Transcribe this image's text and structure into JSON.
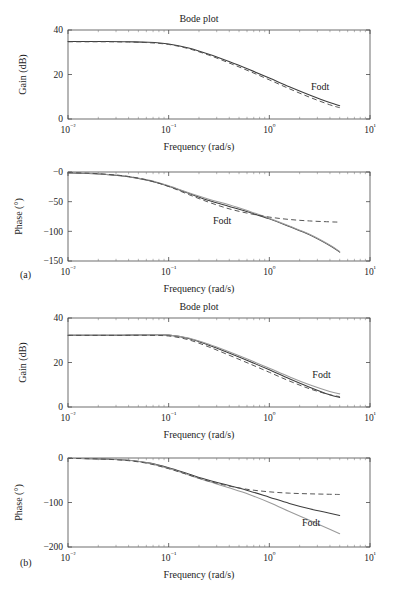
{
  "figure": {
    "panels": [
      {
        "id": "a",
        "label": "(a)"
      },
      {
        "id": "b",
        "label": "(b)"
      }
    ]
  },
  "chart_data": [
    {
      "id": "a-gain",
      "type": "line",
      "title": "Bode plot",
      "xlabel": "Frequency (rad/s)",
      "ylabel": "Gain (dB)",
      "xscale": "log",
      "xlim": [
        0.01,
        10
      ],
      "ylim": [
        0,
        40
      ],
      "xticks": [
        "10⁻²",
        "10⁻¹",
        "10⁰",
        "10¹"
      ],
      "xtick_values": [
        0.01,
        0.1,
        1,
        10
      ],
      "yticks": [
        "0",
        "20",
        "40"
      ],
      "ytick_values": [
        0,
        20,
        40
      ],
      "grid": false,
      "annotations": [
        {
          "text": "Fodt",
          "x": 3.2,
          "y": 13
        }
      ],
      "series": [
        {
          "name": "process",
          "style": "solid",
          "color": "#3d3d3d",
          "x": [
            0.01,
            0.0158,
            0.0251,
            0.0398,
            0.0631,
            0.1,
            0.158,
            0.251,
            0.398,
            0.631,
            1.0,
            1.58,
            2.51,
            3.98,
            5.0
          ],
          "y": [
            34.8,
            34.8,
            34.8,
            34.7,
            34.5,
            33.7,
            31.9,
            29.1,
            25.8,
            22.2,
            18.4,
            14.5,
            10.8,
            7.4,
            6.0
          ]
        },
        {
          "name": "fodt-approximation",
          "style": "dashed",
          "color": "#4d4d4d",
          "x": [
            0.01,
            0.0158,
            0.0251,
            0.0398,
            0.0631,
            0.1,
            0.158,
            0.251,
            0.398,
            0.631,
            1.0,
            1.58,
            2.51,
            3.98,
            5.0
          ],
          "y": [
            34.7,
            34.7,
            34.7,
            34.6,
            34.3,
            33.5,
            31.6,
            28.7,
            25.2,
            21.5,
            17.6,
            13.6,
            9.8,
            6.4,
            5.1
          ]
        }
      ]
    },
    {
      "id": "a-phase",
      "type": "line",
      "title": "",
      "xlabel": "Frequency (rad/s)",
      "ylabel": "Phase (°)",
      "xscale": "log",
      "xlim": [
        0.01,
        10
      ],
      "ylim": [
        -150,
        0
      ],
      "xticks": [
        "10⁻²",
        "10⁻¹",
        "10⁰",
        "10¹"
      ],
      "xtick_values": [
        0.01,
        0.1,
        1,
        10
      ],
      "yticks": [
        "−0",
        "−50",
        "−100",
        "−150"
      ],
      "ytick_values": [
        0,
        -50,
        -100,
        -150
      ],
      "grid": false,
      "annotations": [
        {
          "text": "Fodt",
          "x": 0.34,
          "y": -88
        }
      ],
      "series": [
        {
          "name": "process",
          "style": "solid",
          "color": "#3d3d3d",
          "x": [
            0.01,
            0.0158,
            0.0251,
            0.0398,
            0.0631,
            0.1,
            0.158,
            0.251,
            0.398,
            0.631,
            1.0,
            1.58,
            2.51,
            3.98,
            5.0
          ],
          "y": [
            -1.5,
            -2.5,
            -4.5,
            -8.0,
            -14.5,
            -24.0,
            -36.0,
            -48.0,
            -58.0,
            -68.0,
            -79.0,
            -92.0,
            -106.0,
            -124.0,
            -135.0
          ]
        },
        {
          "name": "process-alt",
          "style": "solid-light",
          "color": "#9a9a9a",
          "x": [
            0.01,
            0.0158,
            0.0251,
            0.0398,
            0.0631,
            0.1,
            0.158,
            0.251,
            0.398,
            0.631,
            1.0,
            1.58,
            2.51,
            3.98,
            5.0
          ],
          "y": [
            -1.2,
            -2.2,
            -4.2,
            -7.5,
            -13.5,
            -23.0,
            -35.0,
            -46.0,
            -55.0,
            -66.0,
            -78.0,
            -91.0,
            -105.0,
            -123.0,
            -134.0
          ]
        },
        {
          "name": "fodt-approximation",
          "style": "dashed",
          "color": "#4d4d4d",
          "x": [
            0.01,
            0.0158,
            0.0251,
            0.0398,
            0.0631,
            0.1,
            0.158,
            0.251,
            0.398,
            0.631,
            1.0,
            1.58,
            2.51,
            3.98,
            5.0
          ],
          "y": [
            -1.0,
            -2.0,
            -4.0,
            -7.5,
            -14.0,
            -24.5,
            -38.0,
            -51.0,
            -62.0,
            -70.0,
            -76.0,
            -80.0,
            -82.5,
            -84.0,
            -84.5
          ]
        }
      ]
    },
    {
      "id": "b-gain",
      "type": "line",
      "title": "Bode plot",
      "xlabel": "Frequency (rad/s)",
      "ylabel": "Gain (dB)",
      "xscale": "log",
      "xlim": [
        0.01,
        10
      ],
      "ylim": [
        0,
        40
      ],
      "xticks": [
        "10⁻²",
        "10⁻¹",
        "10⁰",
        "10¹"
      ],
      "xtick_values": [
        0.01,
        0.1,
        1,
        10
      ],
      "yticks": [
        "0",
        "20",
        "40"
      ],
      "ytick_values": [
        0,
        20,
        40
      ],
      "grid": false,
      "annotations": [
        {
          "text": "Fodt",
          "x": 3.3,
          "y": 13
        }
      ],
      "series": [
        {
          "name": "process",
          "style": "solid",
          "color": "#3d3d3d",
          "x": [
            0.01,
            0.0158,
            0.0251,
            0.0398,
            0.0631,
            0.1,
            0.158,
            0.251,
            0.398,
            0.631,
            1.0,
            1.58,
            2.51,
            3.98,
            5.0
          ],
          "y": [
            32.2,
            32.2,
            32.2,
            32.3,
            32.4,
            32.3,
            30.8,
            27.8,
            24.3,
            20.6,
            16.7,
            12.7,
            8.9,
            5.5,
            4.3
          ]
        },
        {
          "name": "process-alt",
          "style": "solid-light",
          "color": "#9a9a9a",
          "x": [
            0.01,
            0.0158,
            0.0251,
            0.0398,
            0.0631,
            0.1,
            0.158,
            0.251,
            0.398,
            0.631,
            1.0,
            1.58,
            2.51,
            3.98,
            5.0
          ],
          "y": [
            32.3,
            32.3,
            32.3,
            32.4,
            32.5,
            32.4,
            31.0,
            28.2,
            24.8,
            21.2,
            17.4,
            13.6,
            10.0,
            7.0,
            5.9
          ]
        },
        {
          "name": "fodt-approximation",
          "style": "dashed",
          "color": "#4d4d4d",
          "x": [
            0.01,
            0.0158,
            0.0251,
            0.0398,
            0.0631,
            0.1,
            0.158,
            0.251,
            0.398,
            0.631,
            1.0,
            1.58,
            2.51,
            3.98,
            5.0
          ],
          "y": [
            32.2,
            32.2,
            32.2,
            32.2,
            32.2,
            31.9,
            30.2,
            27.0,
            23.3,
            19.5,
            15.6,
            11.7,
            8.2,
            5.5,
            4.7
          ]
        }
      ]
    },
    {
      "id": "b-phase",
      "type": "line",
      "title": "",
      "xlabel": "Frequency (rad/s)",
      "ylabel": "Phase (°)",
      "xscale": "log",
      "xlim": [
        0.01,
        10
      ],
      "ylim": [
        -200,
        0
      ],
      "xticks": [
        "10⁻²",
        "10⁻¹",
        "10⁰",
        "10¹"
      ],
      "xtick_values": [
        0.01,
        0.1,
        1,
        10
      ],
      "yticks": [
        "0",
        "−100",
        "−200"
      ],
      "ytick_values": [
        0,
        -100,
        -200
      ],
      "grid": false,
      "annotations": [
        {
          "text": "Fodt",
          "x": 2.6,
          "y": -152
        }
      ],
      "series": [
        {
          "name": "process",
          "style": "solid",
          "color": "#3d3d3d",
          "x": [
            0.01,
            0.0158,
            0.0251,
            0.0398,
            0.0631,
            0.1,
            0.158,
            0.251,
            0.398,
            0.631,
            1.0,
            1.58,
            2.51,
            3.98,
            5.0
          ],
          "y": [
            -1.0,
            -1.5,
            -2.5,
            -5.0,
            -11.0,
            -22.0,
            -36.0,
            -50.0,
            -62.0,
            -74.0,
            -88.0,
            -102.0,
            -114.0,
            -124.0,
            -129.0
          ]
        },
        {
          "name": "process-alt",
          "style": "solid-light",
          "color": "#9a9a9a",
          "x": [
            0.01,
            0.0158,
            0.0251,
            0.0398,
            0.0631,
            0.1,
            0.158,
            0.251,
            0.398,
            0.631,
            1.0,
            1.58,
            2.51,
            3.98,
            5.0
          ],
          "y": [
            -1.0,
            -1.5,
            -2.5,
            -5.0,
            -11.5,
            -23.5,
            -38.0,
            -53.0,
            -67.0,
            -82.0,
            -100.0,
            -120.0,
            -140.0,
            -160.0,
            -170.0
          ]
        },
        {
          "name": "fodt-approximation",
          "style": "dashed",
          "color": "#4d4d4d",
          "x": [
            0.01,
            0.0158,
            0.0251,
            0.0398,
            0.0631,
            0.1,
            0.158,
            0.251,
            0.398,
            0.631,
            1.0,
            1.58,
            2.51,
            3.98,
            5.0
          ],
          "y": [
            -1.0,
            -1.5,
            -3.0,
            -6.0,
            -12.5,
            -24.0,
            -38.0,
            -52.0,
            -63.0,
            -71.0,
            -76.0,
            -79.0,
            -80.5,
            -81.5,
            -82.0
          ]
        }
      ]
    }
  ]
}
